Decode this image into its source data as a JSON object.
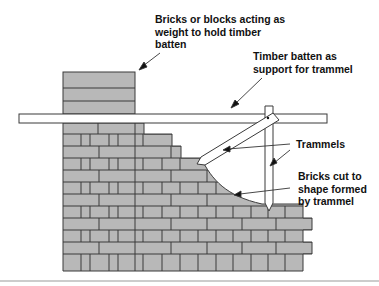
{
  "diagram": {
    "type": "construction-illustration",
    "labels": {
      "weight_bricks": "Bricks or blocks acting as\nweight to hold timber\nbatten",
      "batten": "Timber batten as\nsupport for trammel",
      "trammels": "Trammels",
      "cut_bricks": "Bricks cut to\nshape formed\nby trammel"
    },
    "colors": {
      "brick_fill": "#b8b8b8",
      "mortar_line": "#3a3a3a",
      "timber_fill": "#ffffff",
      "baseline": "#9a9a9a"
    }
  }
}
